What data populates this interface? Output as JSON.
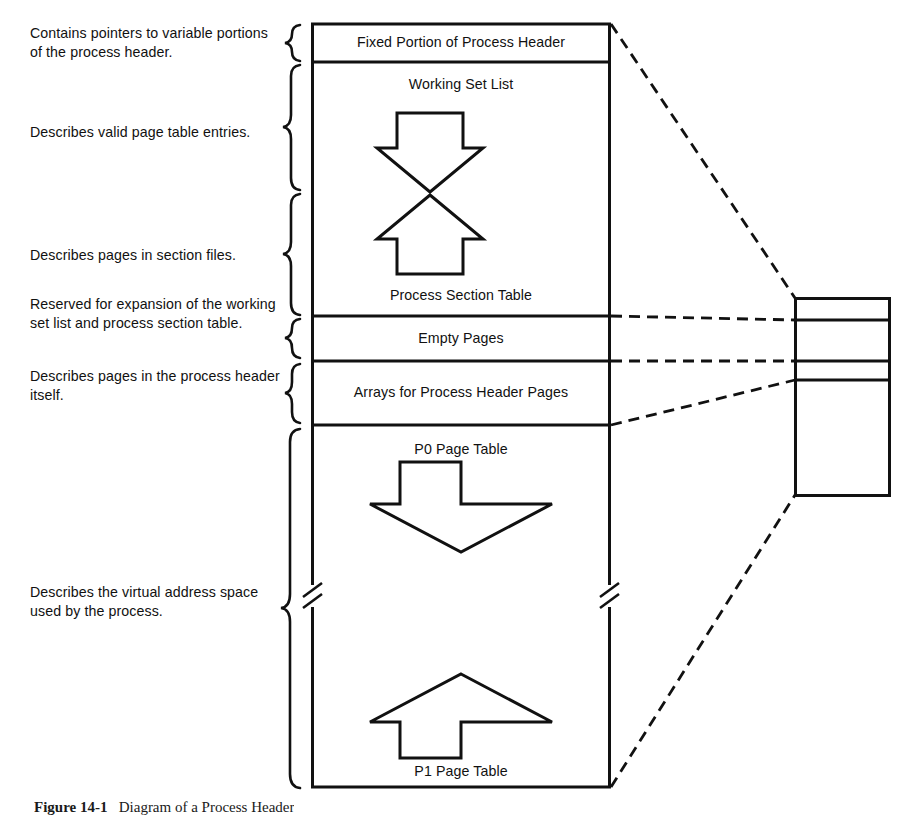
{
  "figure": {
    "caption_label": "Figure 14-1",
    "caption_text": "Diagram of a Process Header",
    "ink_color": "#111111",
    "background_color": "#ffffff"
  },
  "annotations": [
    {
      "id": "fixed-portion",
      "text": "Contains pointers to variable portions of the process header."
    },
    {
      "id": "valid-pte",
      "text": "Describes valid page table entries."
    },
    {
      "id": "section-files",
      "text": "Describes pages in section files."
    },
    {
      "id": "reserved-expansion",
      "text": "Reserved for expansion of the working set list and process section table."
    },
    {
      "id": "process-header-pages",
      "text": "Describes pages in the process header itself."
    },
    {
      "id": "virtual-address-space",
      "text": "Describes the virtual address space used by the process."
    }
  ],
  "header_sections": [
    {
      "id": "fixed-portion-of-process-header",
      "label": "Fixed Portion of Process Header"
    },
    {
      "id": "working-set-list",
      "label": "Working Set List"
    },
    {
      "id": "process-section-table",
      "label": "Process Section Table"
    },
    {
      "id": "empty-pages",
      "label": "Empty Pages"
    },
    {
      "id": "arrays-for-process-header-pages",
      "label": "Arrays for Process Header Pages"
    },
    {
      "id": "p0-page-table",
      "label": "P0 Page Table"
    },
    {
      "id": "p1-page-table",
      "label": "P1 Page Table"
    }
  ],
  "growth_arrows": [
    {
      "id": "working-set-list-growth",
      "direction": "down"
    },
    {
      "id": "process-section-table-growth",
      "direction": "up"
    },
    {
      "id": "p0-page-table-growth",
      "direction": "down"
    },
    {
      "id": "p1-page-table-growth",
      "direction": "up"
    }
  ],
  "detail_panel": {
    "id": "expanded-process-header-pages",
    "rows": [
      "",
      "",
      ""
    ]
  }
}
